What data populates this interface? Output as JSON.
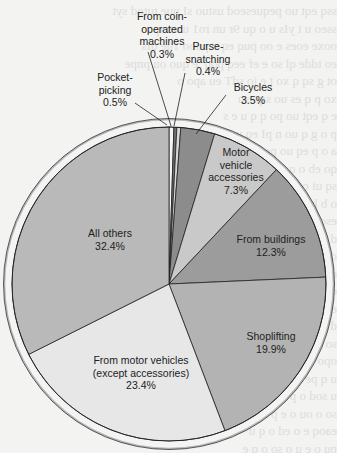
{
  "chart_data": {
    "type": "pie",
    "title": "",
    "start_angle_deg": 0,
    "direction": "clockwise",
    "categories": [
      "Pocket-picking",
      "From coin-operated machines",
      "Purse-snatching",
      "Bicycles",
      "Motor vehicle accessories",
      "From buildings",
      "Shoplifting",
      "From motor vehicles (except accessories)",
      "All others"
    ],
    "values": [
      0.5,
      0.3,
      0.4,
      3.5,
      7.3,
      12.3,
      19.9,
      23.4,
      32.4
    ],
    "unit": "%",
    "colors": [
      "#f4f4f4",
      "#707070",
      "#d8d8d8",
      "#8c8c8c",
      "#c9c9c9",
      "#9c9c9c",
      "#b3b3b3",
      "#e7e7e7",
      "#b9b9b9"
    ],
    "labels": [
      {
        "name": "Pocket-\npicking",
        "pct": "0.5%"
      },
      {
        "name": "From coin-\noperated\nmachines",
        "pct": "0.3%"
      },
      {
        "name": "Purse-\nsnatching",
        "pct": "0.4%"
      },
      {
        "name": "Bicycles",
        "pct": "3.5%"
      },
      {
        "name": "Motor\nvehicle\naccessories",
        "pct": "7.3%"
      },
      {
        "name": "From buildings",
        "pct": "12.3%"
      },
      {
        "name": "Shoplifting",
        "pct": "19.9%"
      },
      {
        "name": "From motor vehicles\n(except accessories)",
        "pct": "23.4%"
      },
      {
        "name": "All others",
        "pct": "32.4%"
      }
    ]
  },
  "labels": {
    "pocket": {
      "l1": "Pocket-",
      "l2": "picking",
      "pct": "0.5%"
    },
    "coin": {
      "l1": "From coin-",
      "l2": "operated",
      "l3": "machines",
      "pct": "0.3%"
    },
    "purse": {
      "l1": "Purse-",
      "l2": "snatching",
      "pct": "0.4%"
    },
    "bicycles": {
      "l1": "Bicycles",
      "pct": "3.5%"
    },
    "accessories": {
      "l1": "Motor",
      "l2": "vehicle",
      "l3": "accessories",
      "pct": "7.3%"
    },
    "buildings": {
      "l1": "From buildings",
      "pct": "12.3%"
    },
    "shoplifting": {
      "l1": "Shoplifting",
      "pct": "19.9%"
    },
    "motor": {
      "l1": "From motor vehicles",
      "l2": "(except accessories)",
      "pct": "23.4%"
    },
    "others": {
      "l1": "All others",
      "pct": "32.4%"
    }
  }
}
